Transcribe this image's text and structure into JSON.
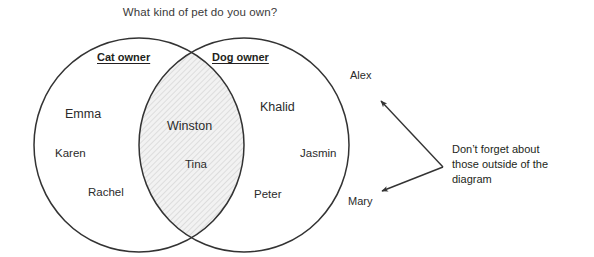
{
  "title": "What kind of pet do you own?",
  "sets": {
    "left": {
      "label": "Cat owner"
    },
    "right": {
      "label": "Dog owner"
    }
  },
  "members": {
    "left_only": [
      {
        "name": "Emma",
        "x": 65,
        "y": 107
      },
      {
        "name": "Karen",
        "x": 55,
        "y": 147
      },
      {
        "name": "Rachel",
        "x": 88,
        "y": 186
      }
    ],
    "intersection": [
      {
        "name": "Winston",
        "x": 167,
        "y": 119
      },
      {
        "name": "Tina",
        "x": 185,
        "y": 158
      }
    ],
    "right_only": [
      {
        "name": "Khalid",
        "x": 260,
        "y": 100
      },
      {
        "name": "Jasmin",
        "x": 300,
        "y": 147
      },
      {
        "name": "Peter",
        "x": 254,
        "y": 188
      }
    ],
    "outside": [
      {
        "name": "Alex",
        "x": 350,
        "y": 69
      },
      {
        "name": "Mary",
        "x": 348,
        "y": 195
      }
    ]
  },
  "annotation": {
    "line1": "Don’t forget about",
    "line2": "those outside of the",
    "line3": "diagram"
  },
  "colors": {
    "stroke": "#333333",
    "text": "#231f20",
    "title_text": "#3a3a3a",
    "hatch_fill": "#f2f2f2",
    "hatch_line": "#cfcfcf",
    "background": "#ffffff"
  },
  "geometry": {
    "left_circle": {
      "cx": 139,
      "cy": 145,
      "rx": 105,
      "ry": 107
    },
    "right_circle": {
      "cx": 244,
      "cy": 145,
      "rx": 105,
      "ry": 107
    },
    "arrows": [
      {
        "from_x": 443,
        "from_y": 167,
        "to_x": 379,
        "to_y": 99
      },
      {
        "from_x": 443,
        "from_y": 167,
        "to_x": 380,
        "to_y": 193
      }
    ]
  }
}
